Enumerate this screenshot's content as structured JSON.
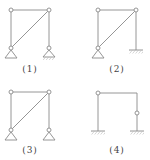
{
  "figures": [
    {
      "id": 1,
      "label": "(1)",
      "description": "Pin-jointed frame with diagonal, two pin supports (left pin, right pin on hatched base)"
    },
    {
      "id": 2,
      "label": "(2)",
      "description": "Pin-jointed frame with diagonal, left pin support, right fixed support"
    },
    {
      "id": 3,
      "label": "(3)",
      "description": "Pin-jointed frame with diagonal, two pin supports"
    },
    {
      "id": 4,
      "label": "(4)",
      "description": "Portal frame, left hinge at top-left, right column with internal hinge, both fixed supports"
    }
  ],
  "colors": {
    "line": "#8a8a8a",
    "text": "#444444",
    "background": "#ffffff"
  }
}
